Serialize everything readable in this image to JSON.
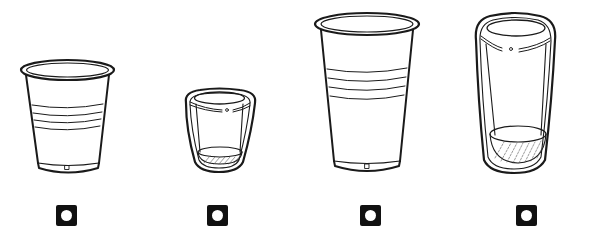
{
  "diagram": {
    "description": "Line illustrations of four drinking cups with circle markers beneath each",
    "stroke_color": "#1a1a1a",
    "background": "#ffffff",
    "marker_color": "#111111",
    "items": [
      {
        "id": "cup-1",
        "kind": "disposable-cup-short",
        "marker": "circle-in-square-icon",
        "center_x": 67
      },
      {
        "id": "cup-2",
        "kind": "tumbler-short-with-holder",
        "marker": "circle-in-square-icon",
        "center_x": 219
      },
      {
        "id": "cup-3",
        "kind": "disposable-cup-tall",
        "marker": "circle-in-square-icon",
        "center_x": 370
      },
      {
        "id": "cup-4",
        "kind": "tumbler-tall-with-holder",
        "marker": "circle-in-square-icon",
        "center_x": 525
      }
    ]
  }
}
